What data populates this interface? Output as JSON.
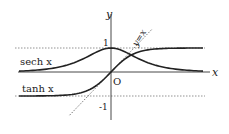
{
  "chart_data": {
    "type": "line",
    "title": "",
    "xlabel": "x",
    "ylabel": "y",
    "origin_label": "O",
    "ticks": {
      "y": [
        {
          "value": 1,
          "label": "1"
        },
        {
          "value": -1,
          "label": "-1"
        }
      ]
    },
    "asymptotes": [
      {
        "y": 1,
        "style": "dotted"
      },
      {
        "y": -1,
        "style": "dotted"
      }
    ],
    "series": [
      {
        "name": "sech x",
        "label": "sech x",
        "function": "sech(x)",
        "x_range": [
          -4,
          4
        ],
        "style": "solid"
      },
      {
        "name": "tanh x",
        "label": "tanh x",
        "function": "tanh(x)",
        "x_range": [
          -4,
          4
        ],
        "style": "solid"
      },
      {
        "name": "y=x",
        "label": "y=x",
        "function": "x",
        "x_range": [
          -1.8,
          1.8
        ],
        "style": "dotted"
      }
    ],
    "xlim": [
      -4.2,
      4.5
    ],
    "ylim": [
      -2,
      2.5
    ],
    "grid": false,
    "legend": "inline labels"
  },
  "labels": {
    "y_axis": "y",
    "x_axis": "x",
    "origin": "O",
    "tick_pos1": "1",
    "tick_neg1": "-1",
    "sech": "sech x",
    "tanh": "tanh x",
    "identity": "y=x"
  }
}
